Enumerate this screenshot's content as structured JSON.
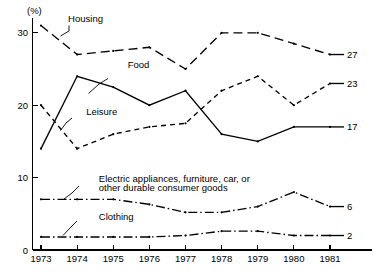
{
  "chart_data": {
    "type": "line",
    "title": "",
    "xlabel": "",
    "ylabel": "",
    "y_unit": "(%)",
    "grid": false,
    "legend_position": "inline-annotations",
    "categories": [
      "1973",
      "1974",
      "1975",
      "1976",
      "1977",
      "1978",
      "1979",
      "1980",
      "1981"
    ],
    "x": [
      1973,
      1974,
      1975,
      1976,
      1977,
      1978,
      1979,
      1980,
      1981
    ],
    "xlim": [
      1973,
      1981
    ],
    "ylim": [
      0,
      32
    ],
    "y_ticks": [
      "0",
      "10",
      "20",
      "30"
    ],
    "y_tick_values": [
      0,
      10,
      20,
      30
    ],
    "series": [
      {
        "name": "Housing",
        "style": "long-dash",
        "values": [
          31,
          27,
          27.5,
          28,
          25,
          30,
          30,
          28.5,
          27
        ],
        "end_label": "27"
      },
      {
        "name": "Food",
        "style": "solid",
        "values": [
          14,
          24,
          22.5,
          20,
          22,
          16,
          15,
          17,
          17
        ],
        "end_label": "17"
      },
      {
        "name": "Leisure",
        "style": "short-dash",
        "values": [
          20,
          14,
          16,
          17,
          17.5,
          22,
          24,
          20,
          23
        ],
        "end_label": "23"
      },
      {
        "name": "Electric appliances, furniture, car, or other durable consumer goods",
        "name_line1": "Electric appliances, furniture, car, or",
        "name_line2": "other durable consumer goods",
        "style": "dash-dot",
        "values": [
          7,
          7,
          7,
          6.3,
          5.2,
          5.2,
          6,
          8,
          6
        ],
        "end_label": "6"
      },
      {
        "name": "Clothing",
        "style": "dash-dot",
        "values": [
          1.8,
          1.8,
          1.8,
          1.8,
          2.0,
          2.6,
          2.6,
          2.0,
          2.0
        ],
        "end_label": "2"
      }
    ],
    "annotations": [
      {
        "text": "Housing",
        "x": 1973.75,
        "y": 31.5
      },
      {
        "text": "Food",
        "x": 1975.4,
        "y": 25.2
      },
      {
        "text": "Leisure",
        "x": 1974.25,
        "y": 18.6
      },
      {
        "text": "Electric appliances, furniture, car, or",
        "x": 1974.6,
        "y": 9.4
      },
      {
        "text": "other durable consumer goods",
        "x": 1974.6,
        "y": 8.1
      },
      {
        "text": "Clothing",
        "x": 1974.6,
        "y": 4.2
      }
    ]
  },
  "colors": {
    "line": "#000000",
    "axis": "#000000",
    "background": "#ffffff"
  }
}
